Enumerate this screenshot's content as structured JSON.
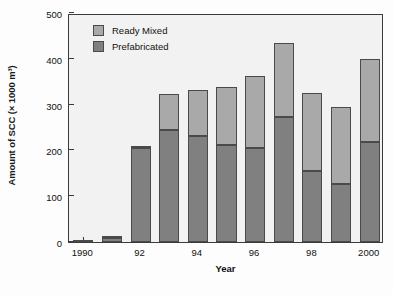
{
  "chart_data": {
    "type": "bar",
    "subtype": "stacked-vertical",
    "title": "",
    "xlabel": "Year",
    "ylabel": "Amount of SCC (× 1000 m³)",
    "ylim": [
      0,
      500
    ],
    "yticks": [
      0,
      100,
      200,
      300,
      400,
      500
    ],
    "ytick_labels": [
      "0",
      "100",
      "200",
      "300",
      "400",
      "500"
    ],
    "grid": false,
    "legend_position": "top-left",
    "categories": [
      "1990",
      "1991",
      "1992",
      "1993",
      "1994",
      "1995",
      "1996",
      "1997",
      "1998",
      "1999",
      "2000"
    ],
    "xtick_labels": [
      "1990",
      "",
      "92",
      "",
      "94",
      "",
      "96",
      "",
      "98",
      "",
      "2000"
    ],
    "series": [
      {
        "name": "Prefabricated",
        "color": "#808080",
        "values": [
          4,
          8,
          205,
          245,
          232,
          212,
          206,
          274,
          154,
          126,
          218
        ]
      },
      {
        "name": "Ready Mixed",
        "color": "#a9a9a9",
        "values": [
          0,
          2,
          4,
          79,
          99,
          127,
          156,
          160,
          172,
          169,
          182
        ]
      }
    ],
    "totals": [
      4,
      10,
      209,
      324,
      331,
      339,
      362,
      434,
      326,
      295,
      400
    ]
  },
  "legend": {
    "entries": [
      {
        "label": "Ready Mixed",
        "swatch": "ready-mixed-swatch"
      },
      {
        "label": "Prefabricated",
        "swatch": "prefabricated-swatch"
      }
    ]
  }
}
